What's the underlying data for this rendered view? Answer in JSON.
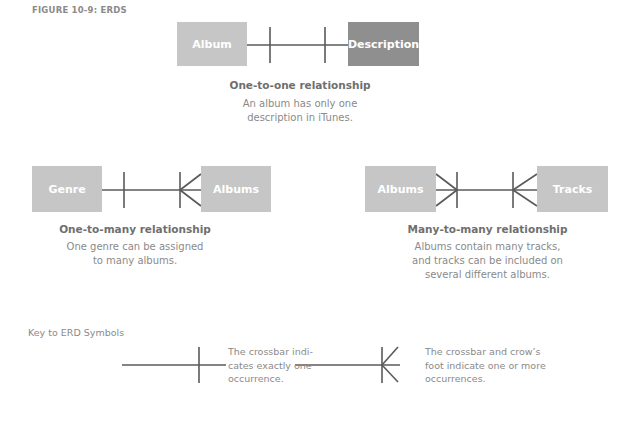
{
  "figure": {
    "title": "FIGURE 10-9: ERDS"
  },
  "diagrams": [
    {
      "type": "one-to-one",
      "entity_left": "Album",
      "entity_right": "Description",
      "caption_title": "One-to-one relationship",
      "caption_lines": [
        "An album has only one",
        "description in iTunes."
      ]
    },
    {
      "type": "one-to-many",
      "entity_left": "Genre",
      "entity_right": "Albums",
      "caption_title": "One-to-many relationship",
      "caption_lines": [
        "One genre can be assigned",
        "to many albums."
      ]
    },
    {
      "type": "many-to-many",
      "entity_left": "Albums",
      "entity_right": "Tracks",
      "caption_title": "Many-to-many relationship",
      "caption_lines": [
        "Albums contain many tracks,",
        "and tracks can be included on",
        "several different albums."
      ]
    }
  ],
  "key": {
    "title": "Key to ERD Symbols",
    "items": [
      {
        "symbol": "crossbar",
        "lines": [
          "The crossbar indi-",
          "cates exactly one",
          "occurrence."
        ]
      },
      {
        "symbol": "crossbar-crows-foot",
        "lines": [
          "The crossbar and crow’s",
          "foot indicate one or more",
          "occurrences."
        ]
      }
    ]
  },
  "colors": {
    "entity_light": "#c6c6c6",
    "entity_dark": "#8f8f8f",
    "line": "#5a5a5a",
    "caption_title": "#6f6f6f",
    "caption_text": "#8a8a8a"
  }
}
